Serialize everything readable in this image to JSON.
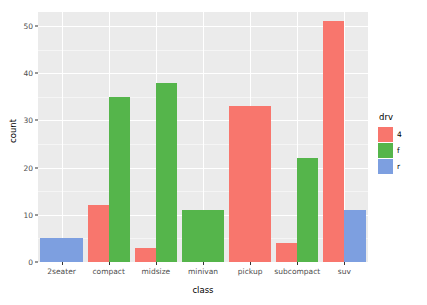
{
  "chart_data": {
    "type": "bar",
    "stacking": "dodge",
    "title": "",
    "xlabel": "class",
    "ylabel": "count",
    "categories": [
      "2seater",
      "compact",
      "midsize",
      "minivan",
      "pickup",
      "subcompact",
      "suv"
    ],
    "series": [
      {
        "name": "4",
        "color": "#f8766d",
        "values": [
          0,
          12,
          3,
          0,
          33,
          4,
          51
        ]
      },
      {
        "name": "f",
        "color": "#55b54b",
        "values": [
          0,
          35,
          38,
          11,
          0,
          22,
          0
        ]
      },
      {
        "name": "r",
        "color": "#7d9fe0",
        "values": [
          5,
          0,
          0,
          0,
          0,
          0,
          11
        ]
      }
    ],
    "ylim": [
      0,
      53
    ],
    "y_ticks": [
      0,
      10,
      20,
      30,
      40,
      50
    ],
    "y_tick_labels": [
      "0",
      "10",
      "20",
      "30",
      "40",
      "50"
    ],
    "grid": true,
    "grid_minor_y": [
      5,
      15,
      25,
      35,
      45
    ],
    "legend": {
      "title": "drv",
      "position": "right",
      "entries": [
        {
          "label": "4",
          "color": "#f8766d"
        },
        {
          "label": "f",
          "color": "#55b54b"
        },
        {
          "label": "r",
          "color": "#7d9fe0"
        }
      ]
    },
    "panel_background": "#ebebeb",
    "plot_background": "#ffffff"
  }
}
